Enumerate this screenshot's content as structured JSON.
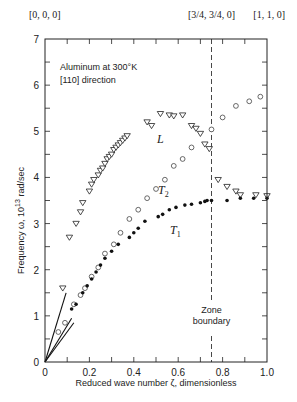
{
  "chart_data": {
    "type": "scatter",
    "title": "Aluminum at 300°K [110] direction",
    "annotation_lines": [
      "Aluminum at 300°K",
      "[110] direction"
    ],
    "xlabel": "Reduced wave number ζ, dimensionless",
    "ylabel": "Frequency ω, 10^13 rad/sec",
    "ylabel_parts": {
      "main": "Frequency ω, 10",
      "sup": "13",
      "unit": " rad/sec"
    },
    "xlim": [
      0,
      1.0
    ],
    "ylim": [
      0,
      7
    ],
    "x_ticks": [
      "0",
      "0.2",
      "0.4",
      "0.6",
      "0.8",
      "1.0"
    ],
    "x_tick_values": [
      0,
      0.2,
      0.4,
      0.6,
      0.8,
      1.0
    ],
    "y_ticks": [
      "0",
      "1",
      "2",
      "3",
      "4",
      "5",
      "6",
      "7"
    ],
    "y_tick_values": [
      0,
      1,
      2,
      3,
      4,
      5,
      6,
      7
    ],
    "grid": false,
    "top_labels": [
      {
        "x": 0,
        "text": "[0, 0, 0]"
      },
      {
        "x": 0.75,
        "text": "[3/4, 3/4, 0]"
      },
      {
        "x": 1.0,
        "text": "[1, 1, 0]"
      }
    ],
    "zone_boundary": {
      "x": 0.75,
      "label_lines": [
        "Zone",
        "boundary"
      ]
    },
    "series": [
      {
        "name": "L",
        "marker": "triangle-down-open",
        "points": [
          [
            0.08,
            1.6
          ],
          [
            0.11,
            2.7
          ],
          [
            0.14,
            3.0
          ],
          [
            0.16,
            3.25
          ],
          [
            0.17,
            3.45
          ],
          [
            0.2,
            3.7
          ],
          [
            0.21,
            3.85
          ],
          [
            0.22,
            3.95
          ],
          [
            0.24,
            4.05
          ],
          [
            0.25,
            4.15
          ],
          [
            0.26,
            4.2
          ],
          [
            0.27,
            4.3
          ],
          [
            0.28,
            4.4
          ],
          [
            0.29,
            4.45
          ],
          [
            0.3,
            4.5
          ],
          [
            0.31,
            4.6
          ],
          [
            0.32,
            4.65
          ],
          [
            0.33,
            4.7
          ],
          [
            0.34,
            4.75
          ],
          [
            0.35,
            4.8
          ],
          [
            0.36,
            4.85
          ],
          [
            0.37,
            4.9
          ],
          [
            0.46,
            5.2
          ],
          [
            0.48,
            5.12
          ],
          [
            0.52,
            5.38
          ],
          [
            0.56,
            5.35
          ],
          [
            0.58,
            5.33
          ],
          [
            0.62,
            5.35
          ],
          [
            0.66,
            5.12
          ],
          [
            0.68,
            5.06
          ],
          [
            0.7,
            4.95
          ],
          [
            0.72,
            4.72
          ],
          [
            0.74,
            4.62
          ],
          [
            0.78,
            3.95
          ],
          [
            0.82,
            3.8
          ],
          [
            0.86,
            3.7
          ],
          [
            0.88,
            3.62
          ],
          [
            0.95,
            3.62
          ],
          [
            1.0,
            3.6
          ]
        ]
      },
      {
        "name": "T2",
        "label": "T",
        "label_sub": "2",
        "marker": "circle-open",
        "points": [
          [
            0.06,
            0.65
          ],
          [
            0.09,
            0.85
          ],
          [
            0.13,
            1.25
          ],
          [
            0.16,
            1.45
          ],
          [
            0.18,
            1.6
          ],
          [
            0.21,
            1.85
          ],
          [
            0.24,
            2.05
          ],
          [
            0.27,
            2.35
          ],
          [
            0.31,
            2.55
          ],
          [
            0.34,
            2.8
          ],
          [
            0.38,
            3.1
          ],
          [
            0.42,
            3.3
          ],
          [
            0.46,
            3.55
          ],
          [
            0.5,
            3.75
          ],
          [
            0.54,
            3.95
          ],
          [
            0.58,
            4.25
          ],
          [
            0.62,
            4.4
          ],
          [
            0.66,
            4.65
          ],
          [
            0.75,
            5.04
          ],
          [
            0.8,
            5.3
          ],
          [
            0.86,
            5.55
          ],
          [
            0.92,
            5.65
          ],
          [
            0.97,
            5.75
          ]
        ]
      },
      {
        "name": "T1",
        "label": "T",
        "label_sub": "1",
        "marker": "circle-filled",
        "points": [
          [
            0.12,
            1.15
          ],
          [
            0.14,
            1.25
          ],
          [
            0.17,
            1.5
          ],
          [
            0.19,
            1.65
          ],
          [
            0.21,
            1.8
          ],
          [
            0.23,
            1.95
          ],
          [
            0.25,
            2.1
          ],
          [
            0.27,
            2.25
          ],
          [
            0.3,
            2.4
          ],
          [
            0.33,
            2.55
          ],
          [
            0.38,
            2.7
          ],
          [
            0.4,
            2.8
          ],
          [
            0.42,
            2.9
          ],
          [
            0.45,
            3.05
          ],
          [
            0.51,
            3.15
          ],
          [
            0.53,
            3.2
          ],
          [
            0.56,
            3.3
          ],
          [
            0.59,
            3.35
          ],
          [
            0.63,
            3.4
          ],
          [
            0.66,
            3.42
          ],
          [
            0.7,
            3.45
          ],
          [
            0.72,
            3.48
          ],
          [
            0.73,
            3.5
          ],
          [
            0.75,
            3.5
          ],
          [
            0.82,
            3.5
          ],
          [
            0.88,
            3.55
          ],
          [
            0.94,
            3.55
          ],
          [
            1.0,
            3.55
          ]
        ]
      }
    ],
    "initial_slope_lines": [
      {
        "name": "L-slope",
        "from": [
          0,
          0
        ],
        "to": [
          0.095,
          1.5
        ]
      },
      {
        "name": "T2-slope",
        "from": [
          0,
          0
        ],
        "to": [
          0.12,
          0.95
        ]
      },
      {
        "name": "T1-slope",
        "from": [
          0,
          0
        ],
        "to": [
          0.13,
          0.85
        ]
      }
    ]
  }
}
